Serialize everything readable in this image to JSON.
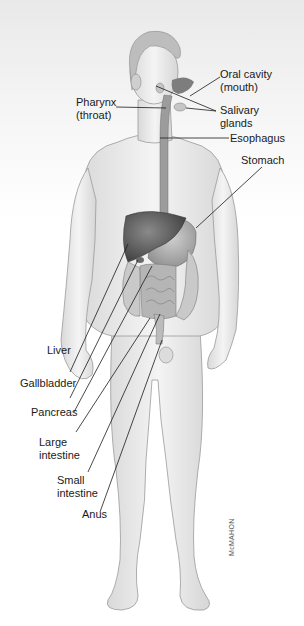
{
  "diagram": {
    "labels": [
      {
        "id": "oral-cavity",
        "line1": "Oral cavity",
        "line2": "(mouth)"
      },
      {
        "id": "pharynx",
        "line1": "Pharynx",
        "line2": "(throat)"
      },
      {
        "id": "salivary-glands",
        "line1": "Salivary",
        "line2": "glands"
      },
      {
        "id": "esophagus",
        "line1": "Esophagus",
        "line2": ""
      },
      {
        "id": "stomach",
        "line1": "Stomach",
        "line2": ""
      },
      {
        "id": "liver",
        "line1": "Liver",
        "line2": ""
      },
      {
        "id": "gallbladder",
        "line1": "Gallbladder",
        "line2": ""
      },
      {
        "id": "pancreas",
        "line1": "Pancreas",
        "line2": ""
      },
      {
        "id": "large-intestine",
        "line1": "Large",
        "line2": "intestine"
      },
      {
        "id": "small-intestine",
        "line1": "Small",
        "line2": "intestine"
      },
      {
        "id": "anus",
        "line1": "Anus",
        "line2": ""
      }
    ],
    "signature": "McMAHON"
  }
}
